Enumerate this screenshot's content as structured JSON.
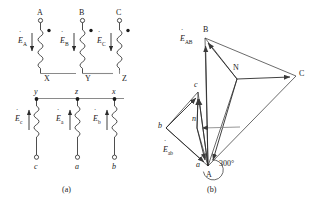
{
  "figure": {
    "captions": {
      "a": "(a)",
      "b": "(b)"
    },
    "colors": {
      "line": "#3a3a3a",
      "text": "#1a1a1a",
      "background": "#ffffff",
      "bus": "#8a8a8a"
    }
  },
  "circuit": {
    "name": "winding-connection-diagram",
    "primary": {
      "top_terminals": [
        "A",
        "B",
        "C"
      ],
      "bottom_terminals": [
        "X",
        "Y",
        "Z"
      ],
      "emf_labels": [
        "E",
        "E",
        "E"
      ],
      "emf_subscripts": [
        "A",
        "B",
        "C"
      ],
      "emf_full": [
        "ĖA",
        "ĖB",
        "ĖC"
      ],
      "emf_direction": "down",
      "polarity_marker": "dot"
    },
    "secondary": {
      "top_terminals": [
        "y",
        "z",
        "x"
      ],
      "bottom_terminals": [
        "c",
        "a",
        "b"
      ],
      "emf_labels": [
        "E",
        "E",
        "E"
      ],
      "emf_subscripts": [
        "c",
        "a",
        "b"
      ],
      "emf_full": [
        "Ėc",
        "Ėa",
        "Ėb"
      ],
      "emf_direction": "up",
      "polarity_marker": "dot"
    }
  },
  "phasor": {
    "name": "phasor-diagram",
    "primary_vertices": [
      "A",
      "B",
      "C"
    ],
    "primary_neutral": "N",
    "secondary_vertices": [
      "a",
      "b",
      "c"
    ],
    "secondary_neutral": "n",
    "voltage_labels": {
      "primary_line": "ĖAB",
      "primary_line_sym": "E",
      "primary_line_sub": "AB",
      "secondary_line": "Ėab",
      "secondary_line_sym": "E",
      "secondary_line_sub": "ab"
    },
    "phase_displacement": "300°",
    "phase_displacement_value": 300,
    "phase_unit": "degrees"
  }
}
